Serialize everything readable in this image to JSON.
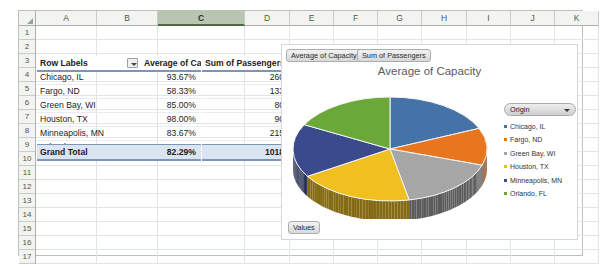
{
  "spreadsheet": {
    "columns": [
      "A",
      "B",
      "C",
      "D",
      "E",
      "F",
      "G",
      "H",
      "I",
      "J",
      "K"
    ],
    "selected_column": "C",
    "rows": [
      "1",
      "2",
      "3",
      "4",
      "5",
      "6",
      "7",
      "8",
      "9",
      "10",
      "11",
      "12",
      "13",
      "14",
      "15",
      "16",
      "17"
    ]
  },
  "pivot": {
    "headers": [
      "Row Labels",
      "Average of Capacity",
      "Sum of Passengers"
    ],
    "filter_icon": "filter-dropdown-icon",
    "rows": [
      {
        "label": "Chicago, IL",
        "capacity": "93.67%",
        "passengers": "260"
      },
      {
        "label": "Fargo, ND",
        "capacity": "58.33%",
        "passengers": "133"
      },
      {
        "label": "Green Bay, WI",
        "capacity": "85.00%",
        "passengers": "80"
      },
      {
        "label": "Houston, TX",
        "capacity": "98.00%",
        "passengers": "90"
      },
      {
        "label": "Minneapolis, MN",
        "capacity": "83.67%",
        "passengers": "215"
      },
      {
        "label": "Orlando, FL",
        "capacity": "87.33%",
        "passengers": "240"
      }
    ],
    "total": {
      "label": "Grand Total",
      "capacity": "82.29%",
      "passengers": "1018"
    }
  },
  "chart": {
    "title": "Average of Capacity",
    "field_buttons": [
      "Average of Capacity",
      "Sum of Passengers"
    ],
    "values_button": "Values",
    "legend_title": "Origin",
    "legend_dropdown_icon": "chevron-down-icon"
  },
  "chart_data": {
    "type": "pie",
    "title": "Average of Capacity",
    "categories": [
      "Chicago, IL",
      "Fargo, ND",
      "Green Bay, WI",
      "Houston, TX",
      "Minneapolis, MN",
      "Orlando, FL"
    ],
    "values": [
      93.67,
      58.33,
      85.0,
      98.0,
      83.67,
      87.33
    ],
    "value_format": "percent",
    "colors": [
      "#4572A7",
      "#E8761E",
      "#A6A6A6",
      "#F0C020",
      "#3A4A8C",
      "#6BA83A"
    ],
    "legend": {
      "title": "Origin",
      "position": "right"
    },
    "three_d": true,
    "xlabel": "",
    "ylabel": ""
  }
}
